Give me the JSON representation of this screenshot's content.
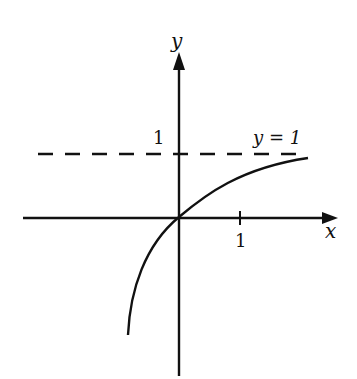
{
  "figure": {
    "type": "function-graph",
    "y_axis_label": "y",
    "x_axis_label": "x",
    "y_tick_label": "1",
    "x_tick_label": "1",
    "asymptote_label": "y = 1",
    "curve": "increasing concave curve through origin approaching y = 1",
    "colors": {
      "ink": "#111111",
      "background": "#ffffff"
    }
  }
}
